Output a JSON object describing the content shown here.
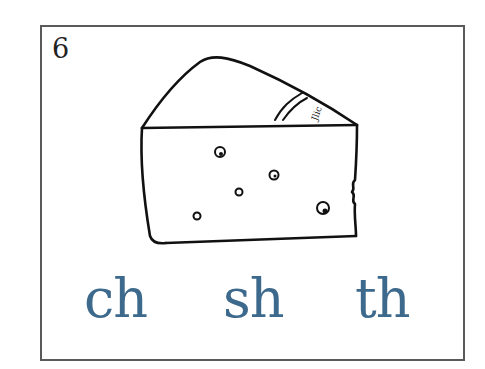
{
  "card": {
    "number": "6",
    "image": "cheese-wedge-icon",
    "choices": [
      {
        "label": "ch"
      },
      {
        "label": "sh"
      },
      {
        "label": "th"
      }
    ],
    "choice_color": "#3d6a8c"
  }
}
